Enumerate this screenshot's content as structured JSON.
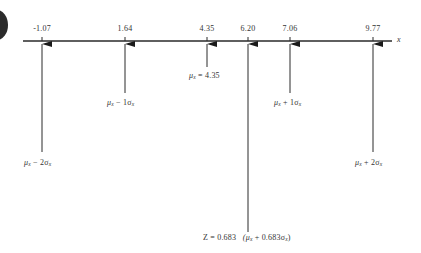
{
  "figure": {
    "axis_label": "x",
    "ticks": [
      {
        "value": "-1.07",
        "x": 42
      },
      {
        "value": "1.64",
        "x": 125
      },
      {
        "value": "4.35",
        "x": 207
      },
      {
        "value": "6.20",
        "x": 248
      },
      {
        "value": "7.06",
        "x": 290
      },
      {
        "value": "9.77",
        "x": 373
      }
    ],
    "labels": {
      "minus2sigma": {
        "mu": "μ",
        "sub": "x",
        "rest": " − 2σ",
        "sub2": "x"
      },
      "minus1sigma": {
        "mu": "μ",
        "sub": "x",
        "rest": " − 1σ",
        "sub2": "x"
      },
      "mean": {
        "mu": "μ",
        "sub": "x",
        "rest": " = 4.35"
      },
      "plus1sigma": {
        "mu": "μ",
        "sub": "x",
        "rest": " + 1σ",
        "sub2": "x"
      },
      "plus2sigma": {
        "mu": "μ",
        "sub": "x",
        "rest": " + 2σ",
        "sub2": "x"
      },
      "z_value": {
        "prefix": "Z = 0.683",
        "open": "(μ",
        "sub": "x",
        "rest": " + 0.683σ",
        "sub2": "x",
        "close": ")"
      }
    },
    "colors": {
      "line": "#2a2a2a",
      "text": "#333333",
      "badge": "#2b2b2b"
    }
  }
}
